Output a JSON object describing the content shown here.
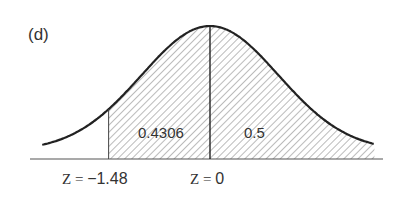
{
  "chart_data": {
    "type": "area",
    "title": "(d)",
    "distribution": "standard normal",
    "x_range": [
      -2.45,
      2.4
    ],
    "shaded_from": -1.48,
    "shaded_to": "inf",
    "divider_at": 0,
    "regions": [
      {
        "name": "left-region",
        "from": -1.48,
        "to": 0,
        "label": "0.4306"
      },
      {
        "name": "right-region",
        "from": 0,
        "to": "inf",
        "label": "0.5"
      }
    ],
    "tick_labels": [
      {
        "z": -1.48,
        "prefix": "Z = ",
        "value": "−1.48"
      },
      {
        "z": 0,
        "prefix": "Z = ",
        "value": "0"
      }
    ],
    "grid": false,
    "legend": "none"
  },
  "colors": {
    "curve": "#222222",
    "hatch": "#666666",
    "axis": "#555555"
  }
}
